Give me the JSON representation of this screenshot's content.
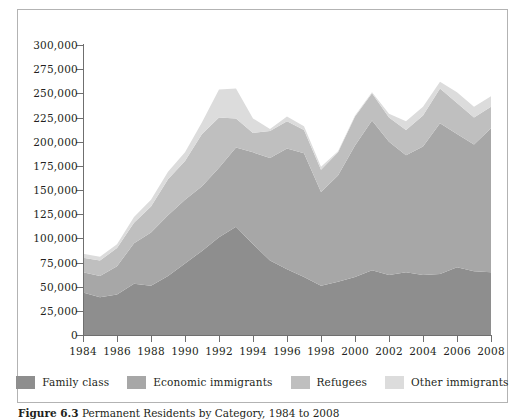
{
  "figure": {
    "caption_label": "Figure 6.3",
    "caption_text": "Permanent Residents by Category, 1984 to 2008"
  },
  "colors": {
    "family_class": "#8e8e8e",
    "economic_immigrants": "#a7a7a7",
    "refugees": "#bfbfbf",
    "other_immigrants": "#dcdcdc",
    "axis": "#6f6f6f",
    "frame": "#b3b3b3",
    "text": "#231f20",
    "background": "#ffffff"
  },
  "axes": {
    "y_ticks": [
      "0",
      "25,000",
      "50,000",
      "75,000",
      "100,000",
      "125,000",
      "150,000",
      "175,000",
      "200,000",
      "225,000",
      "250,000",
      "275,000",
      "300,000"
    ],
    "x_ticks": [
      "1984",
      "1986",
      "1988",
      "1990",
      "1992",
      "1994",
      "1996",
      "1998",
      "2000",
      "2002",
      "2004",
      "2006",
      "2008"
    ]
  },
  "legend": {
    "items": [
      {
        "label": "Family class",
        "color": "#8e8e8e"
      },
      {
        "label": "Economic immigrants",
        "color": "#a7a7a7"
      },
      {
        "label": "Refugees",
        "color": "#bfbfbf"
      },
      {
        "label": "Other immigrants",
        "color": "#dcdcdc"
      }
    ]
  },
  "chart_data": {
    "type": "area",
    "stacked": true,
    "title": "Permanent Residents by Category, 1984 to 2008",
    "xlabel": "",
    "ylabel": "",
    "xlim": [
      1984,
      2008
    ],
    "ylim": [
      0,
      300000
    ],
    "ytick_step": 25000,
    "xtick_step": 2,
    "grid": false,
    "legend_position": "bottom",
    "x": [
      1984,
      1985,
      1986,
      1987,
      1988,
      1989,
      1990,
      1991,
      1992,
      1993,
      1994,
      1995,
      1996,
      1997,
      1998,
      1999,
      2000,
      2001,
      2002,
      2003,
      2004,
      2005,
      2006,
      2007,
      2008
    ],
    "series": [
      {
        "name": "Family class",
        "color": "#8e8e8e",
        "values": [
          44000,
          39000,
          42000,
          53000,
          51000,
          61000,
          74000,
          87000,
          101000,
          112000,
          94000,
          77000,
          68000,
          60000,
          51000,
          55000,
          60000,
          67000,
          62000,
          65000,
          62000,
          63000,
          70000,
          66000,
          65000
        ]
      },
      {
        "name": "Economic immigrants",
        "color": "#a7a7a7",
        "values": [
          21000,
          22000,
          29000,
          42000,
          55000,
          63000,
          66000,
          67000,
          72000,
          82000,
          95000,
          106000,
          125000,
          128000,
          97000,
          110000,
          136000,
          155000,
          138000,
          121000,
          133000,
          156000,
          138000,
          131000,
          149000
        ]
      },
      {
        "name": "Refugees",
        "color": "#bfbfbf",
        "values": [
          15000,
          16000,
          19000,
          21000,
          27000,
          37000,
          40000,
          54000,
          52000,
          30000,
          20000,
          28000,
          28000,
          24000,
          23000,
          24000,
          30000,
          28000,
          25000,
          26000,
          32000,
          36000,
          32000,
          28000,
          22000
        ]
      },
      {
        "name": "Other immigrants",
        "color": "#dcdcdc",
        "values": [
          4000,
          4000,
          4000,
          6000,
          7000,
          8000,
          9000,
          12000,
          29000,
          31000,
          15000,
          2000,
          5000,
          4000,
          3000,
          1000,
          1000,
          1000,
          4000,
          9000,
          9000,
          7000,
          11000,
          11000,
          11000
        ]
      }
    ]
  }
}
